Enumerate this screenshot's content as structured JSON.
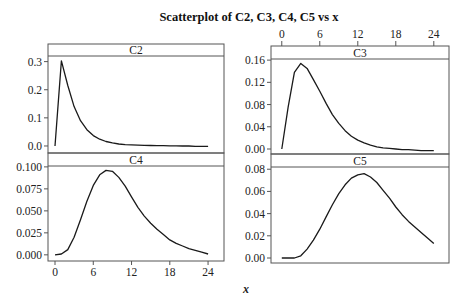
{
  "chart_data": {
    "type": "line",
    "title": "Scatterplot of C2, C3, C4, C5 vs x",
    "xlabel": "x",
    "ylabel": "",
    "grid": false,
    "legend": "none",
    "layout": "2x2 panels",
    "x": [
      0,
      1,
      2,
      3,
      4,
      5,
      6,
      7,
      8,
      9,
      10,
      11,
      12,
      13,
      14,
      15,
      16,
      17,
      18,
      19,
      20,
      21,
      22,
      23,
      24
    ],
    "xticks": [
      0,
      6,
      12,
      18,
      24
    ],
    "xtick_labels": [
      "0",
      "6",
      "12",
      "18",
      "24"
    ],
    "panels": [
      {
        "name": "C2",
        "position": "top-left",
        "xlim": [
          -1.1,
          26.5
        ],
        "ylim": [
          -0.025,
          0.32
        ],
        "yticks": [
          0.0,
          0.1,
          0.2,
          0.3
        ],
        "ytick_labels": [
          "0.0",
          "0.1",
          "0.2",
          "0.3"
        ],
        "x_axis": "none",
        "values": [
          0,
          0.303,
          0.215,
          0.14,
          0.09,
          0.058,
          0.037,
          0.024,
          0.016,
          0.011,
          0.007,
          0.005,
          0.004,
          0.003,
          0.002,
          0.0015,
          0.001,
          0.001,
          0.0005,
          0.0005,
          0,
          0,
          -0.001,
          -0.001,
          -0.001
        ]
      },
      {
        "name": "C3",
        "position": "top-right",
        "xlim": [
          -1.7,
          26.4
        ],
        "ylim": [
          -0.009,
          0.162
        ],
        "yticks": [
          0.0,
          0.04,
          0.08,
          0.12,
          0.16
        ],
        "ytick_labels": [
          "0.00",
          "0.04",
          "0.08",
          "0.12",
          "0.16"
        ],
        "x_axis": "top",
        "values": [
          0,
          0.075,
          0.138,
          0.154,
          0.145,
          0.125,
          0.104,
          0.082,
          0.062,
          0.046,
          0.033,
          0.023,
          0.016,
          0.011,
          0.007,
          0.004,
          0.002,
          0.001,
          0.0,
          -0.001,
          -0.001,
          -0.002,
          -0.003,
          -0.003,
          -0.003
        ]
      },
      {
        "name": "C4",
        "position": "bottom-left",
        "xlim": [
          -1.1,
          26.5
        ],
        "ylim": [
          -0.007,
          0.101
        ],
        "yticks": [
          0.0,
          0.025,
          0.05,
          0.075,
          0.1
        ],
        "ytick_labels": [
          "0.000",
          "0.025",
          "0.050",
          "0.075",
          "0.100"
        ],
        "x_axis": "bottom",
        "values": [
          0.0,
          0.001,
          0.006,
          0.02,
          0.04,
          0.061,
          0.079,
          0.091,
          0.096,
          0.095,
          0.088,
          0.078,
          0.066,
          0.054,
          0.044,
          0.036,
          0.029,
          0.023,
          0.017,
          0.013,
          0.01,
          0.007,
          0.005,
          0.003,
          0.001
        ]
      },
      {
        "name": "C5",
        "position": "bottom-right",
        "xlim": [
          -1.7,
          26.4
        ],
        "ylim": [
          -0.0045,
          0.082
        ],
        "yticks": [
          0.0,
          0.02,
          0.04,
          0.06,
          0.08
        ],
        "ytick_labels": [
          "0.00",
          "0.02",
          "0.04",
          "0.06",
          "0.08"
        ],
        "x_axis": "none",
        "values": [
          0.0,
          0.0,
          0.0,
          0.002,
          0.008,
          0.016,
          0.026,
          0.037,
          0.048,
          0.058,
          0.066,
          0.072,
          0.075,
          0.076,
          0.073,
          0.068,
          0.061,
          0.054,
          0.046,
          0.039,
          0.033,
          0.028,
          0.023,
          0.018,
          0.013
        ]
      }
    ]
  }
}
